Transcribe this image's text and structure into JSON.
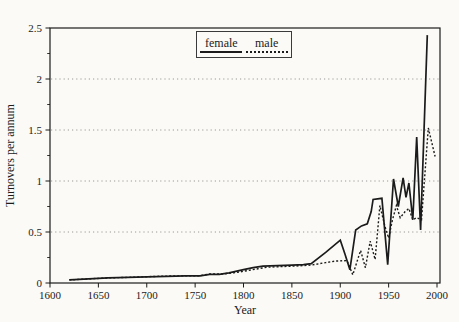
{
  "figure": {
    "background_color": "#fbfaf6",
    "line_color": "#1b1b1b",
    "grid_color": "#8f8f8f"
  },
  "chart_data": {
    "type": "line",
    "title": "",
    "xlabel": "Year",
    "ylabel": "Turnovers per annum",
    "xlim": [
      1600,
      2000
    ],
    "ylim": [
      0,
      2.5
    ],
    "grid": "horizontal dotted at y-major ticks",
    "legend_position": "top-center",
    "x_ticks": [
      {
        "v": 1600,
        "label": "1600"
      },
      {
        "v": 1650,
        "label": "1650"
      },
      {
        "v": 1700,
        "label": "1700"
      },
      {
        "v": 1750,
        "label": "1750"
      },
      {
        "v": 1800,
        "label": "1800"
      },
      {
        "v": 1850,
        "label": "1850"
      },
      {
        "v": 1900,
        "label": "1900"
      },
      {
        "v": 1950,
        "label": "1950"
      },
      {
        "v": 2000,
        "label": "2000"
      }
    ],
    "y_ticks": [
      {
        "v": 0,
        "label": "0"
      },
      {
        "v": 0.5,
        "label": "0.5"
      },
      {
        "v": 1,
        "label": "1"
      },
      {
        "v": 1.5,
        "label": "1.5"
      },
      {
        "v": 2,
        "label": "2"
      },
      {
        "v": 2.5,
        "label": "2.5"
      }
    ],
    "y_minor_ticks": [
      0.25,
      0.75,
      1.25,
      1.75,
      2.25
    ],
    "grid_lines": [
      0.5,
      1,
      1.5,
      2
    ],
    "series": [
      {
        "name": "female",
        "style": "solid",
        "points": [
          [
            1620,
            0.03
          ],
          [
            1640,
            0.04
          ],
          [
            1660,
            0.05
          ],
          [
            1680,
            0.055
          ],
          [
            1700,
            0.06
          ],
          [
            1720,
            0.065
          ],
          [
            1740,
            0.07
          ],
          [
            1755,
            0.07
          ],
          [
            1765,
            0.085
          ],
          [
            1775,
            0.085
          ],
          [
            1785,
            0.1
          ],
          [
            1800,
            0.13
          ],
          [
            1810,
            0.15
          ],
          [
            1820,
            0.165
          ],
          [
            1835,
            0.17
          ],
          [
            1850,
            0.175
          ],
          [
            1862,
            0.18
          ],
          [
            1870,
            0.19
          ],
          [
            1885,
            0.3
          ],
          [
            1900,
            0.42
          ],
          [
            1905,
            0.28
          ],
          [
            1910,
            0.13
          ],
          [
            1916,
            0.52
          ],
          [
            1922,
            0.56
          ],
          [
            1928,
            0.58
          ],
          [
            1932,
            0.7
          ],
          [
            1934,
            0.82
          ],
          [
            1943,
            0.83
          ],
          [
            1949,
            0.18
          ],
          [
            1955,
            1.02
          ],
          [
            1960,
            0.75
          ],
          [
            1965,
            1.03
          ],
          [
            1968,
            0.84
          ],
          [
            1971,
            0.98
          ],
          [
            1975,
            0.62
          ],
          [
            1979,
            1.43
          ],
          [
            1983,
            0.52
          ],
          [
            1990,
            2.43
          ]
        ]
      },
      {
        "name": "male",
        "style": "dashed",
        "points": [
          [
            1620,
            0.03
          ],
          [
            1640,
            0.04
          ],
          [
            1660,
            0.05
          ],
          [
            1680,
            0.055
          ],
          [
            1700,
            0.062
          ],
          [
            1720,
            0.068
          ],
          [
            1740,
            0.072
          ],
          [
            1755,
            0.072
          ],
          [
            1765,
            0.088
          ],
          [
            1778,
            0.088
          ],
          [
            1790,
            0.1
          ],
          [
            1800,
            0.115
          ],
          [
            1815,
            0.14
          ],
          [
            1825,
            0.155
          ],
          [
            1850,
            0.165
          ],
          [
            1870,
            0.175
          ],
          [
            1885,
            0.2
          ],
          [
            1895,
            0.215
          ],
          [
            1907,
            0.22
          ],
          [
            1913,
            0.08
          ],
          [
            1921,
            0.32
          ],
          [
            1926,
            0.15
          ],
          [
            1931,
            0.41
          ],
          [
            1936,
            0.23
          ],
          [
            1941,
            0.76
          ],
          [
            1946,
            0.56
          ],
          [
            1950,
            0.44
          ],
          [
            1954,
            0.62
          ],
          [
            1958,
            0.76
          ],
          [
            1962,
            0.64
          ],
          [
            1967,
            0.7
          ],
          [
            1971,
            0.73
          ],
          [
            1975,
            0.62
          ],
          [
            1979,
            0.64
          ],
          [
            1984,
            0.62
          ],
          [
            1991,
            1.52
          ],
          [
            1998,
            1.24
          ]
        ]
      }
    ]
  }
}
